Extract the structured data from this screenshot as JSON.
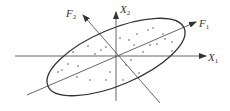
{
  "diagram": {
    "colors": {
      "stroke": "#333333",
      "axis": "#555555",
      "background": "#ffffff"
    },
    "labels": {
      "x1": {
        "main": "X",
        "sub": "1"
      },
      "x2": {
        "main": "X",
        "sub": "2"
      },
      "f1": {
        "main": "F",
        "sub": "1"
      },
      "f2": {
        "main": "F",
        "sub": "2"
      }
    },
    "center": [
      116,
      57
    ],
    "ellipse": {
      "rx": 74,
      "ry": 28,
      "rotation_deg": -23
    },
    "points": [
      [
        88,
        46
      ],
      [
        101,
        50
      ],
      [
        73,
        52
      ],
      [
        95,
        54
      ],
      [
        106,
        47
      ],
      [
        129,
        40
      ],
      [
        137,
        34
      ],
      [
        148,
        30
      ],
      [
        157,
        44
      ],
      [
        165,
        39
      ],
      [
        172,
        51
      ],
      [
        143,
        52
      ],
      [
        131,
        60
      ],
      [
        126,
        65
      ],
      [
        123,
        80
      ],
      [
        139,
        73
      ],
      [
        110,
        72
      ],
      [
        106,
        80
      ],
      [
        90,
        80
      ],
      [
        77,
        77
      ],
      [
        62,
        70
      ],
      [
        68,
        64
      ],
      [
        78,
        66
      ],
      [
        58,
        72
      ],
      [
        153,
        28
      ],
      [
        163,
        34
      ],
      [
        172,
        42
      ],
      [
        150,
        45
      ],
      [
        120,
        38
      ],
      [
        134,
        45
      ]
    ]
  }
}
